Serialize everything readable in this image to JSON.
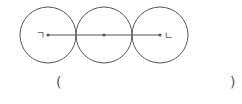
{
  "diagram": {
    "circles": [
      {
        "cx": 48,
        "cy": 35,
        "r": 28
      },
      {
        "cx": 104,
        "cy": 35,
        "r": 28
      },
      {
        "cx": 160,
        "cy": 35,
        "r": 28
      }
    ],
    "label_left": "ㄱ",
    "label_right": "ㄴ",
    "stroke_color": "#555555"
  },
  "answer": {
    "open_paren": "(",
    "close_paren": ")",
    "value": ""
  }
}
